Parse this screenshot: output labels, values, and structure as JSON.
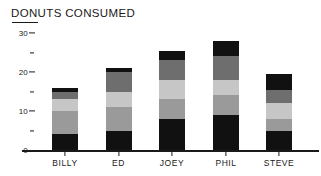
{
  "chart_data": {
    "type": "bar",
    "subtype": "stacked-bar",
    "title": "DONUTS CONSUMED",
    "xlabel": "",
    "ylabel": "",
    "ylim": [
      0,
      30
    ],
    "grid": false,
    "legend": "none",
    "y_major_ticks": [
      0,
      10,
      20,
      30
    ],
    "y_minor_ticks": [
      5,
      15,
      25
    ],
    "y_tick_labels": [
      "0",
      "10",
      "20",
      "30"
    ],
    "categories": [
      "BILLY",
      "ED",
      "JOEY",
      "PHIL",
      "STEVE"
    ],
    "series": [
      {
        "name": "segment-1",
        "color": "#111111",
        "values": [
          4,
          5,
          8,
          9,
          5
        ]
      },
      {
        "name": "segment-2",
        "color": "#9a9a9a",
        "values": [
          6,
          6,
          5,
          5,
          3
        ]
      },
      {
        "name": "segment-3",
        "color": "#c6c6c6",
        "values": [
          3,
          4,
          5,
          4,
          4
        ]
      },
      {
        "name": "segment-4",
        "color": "#6e6e6e",
        "values": [
          2,
          5,
          5,
          6,
          3.5
        ]
      },
      {
        "name": "segment-5",
        "color": "#111111",
        "values": [
          1,
          1,
          2.5,
          4,
          4
        ]
      }
    ],
    "totals": [
      16,
      21,
      25.5,
      28,
      19.5
    ]
  },
  "colors": {
    "ink": "#1a1a1a",
    "background": "#ffffff",
    "black_segment": "#111111",
    "dark_gray_segment": "#6e6e6e",
    "light_gray_segment": "#c6c6c6",
    "mid_gray_segment": "#9a9a9a"
  }
}
